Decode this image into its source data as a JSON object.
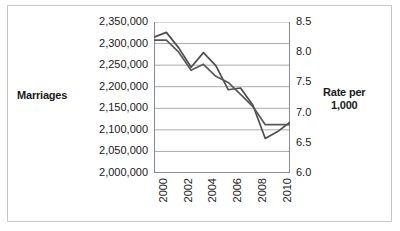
{
  "chart_data": {
    "type": "line",
    "title": "",
    "subtitle": "",
    "xlabel": "",
    "ylabel": "Marriages",
    "y2label": "Rate per 1,000",
    "grid": true,
    "legend": "none",
    "x": [
      2000,
      2001,
      2002,
      2003,
      2004,
      2005,
      2006,
      2007,
      2008,
      2009,
      2010,
      2011
    ],
    "xtick_labels": [
      "2000",
      "2002",
      "2004",
      "2006",
      "2008",
      "2010"
    ],
    "xtick_values": [
      2000,
      2002,
      2004,
      2006,
      2008,
      2010
    ],
    "xlim": [
      2000,
      2011
    ],
    "ylim": [
      2000000,
      2350000
    ],
    "ytick_labels": [
      "2,350,000",
      "2,300,000",
      "2,250,000",
      "2,200,000",
      "2,150,000",
      "2,100,000",
      "2,050,000",
      "2,000,000"
    ],
    "ytick_values": [
      2350000,
      2300000,
      2250000,
      2200000,
      2150000,
      2100000,
      2050000,
      2000000
    ],
    "y2lim": [
      6.0,
      8.5
    ],
    "y2tick_labels": [
      "8.5",
      "8.0",
      "7.5",
      "7.0",
      "6.5",
      "6.0"
    ],
    "y2tick_values": [
      8.5,
      8.0,
      7.5,
      7.0,
      6.5,
      6.0
    ],
    "series": [
      {
        "name": "Marriages",
        "axis": "left",
        "color": "#4d4d4d",
        "values": [
          2315000,
          2326000,
          2290000,
          2245000,
          2279000,
          2249000,
          2193000,
          2197000,
          2157000,
          2080000,
          2096000,
          2118000
        ]
      },
      {
        "name": "Rate per 1,000",
        "axis": "right",
        "color": "#595959",
        "values": [
          8.2,
          8.2,
          8.0,
          7.7,
          7.8,
          7.6,
          7.5,
          7.3,
          7.1,
          6.8,
          6.8,
          6.8
        ]
      }
    ],
    "colors": {
      "marriages_line": "#4d4d4d",
      "rate_line": "#595959",
      "gridline": "#aaaaaa",
      "axis": "#8c8c8c",
      "frame": "#c9c9c9",
      "text": "#1a1a1a"
    }
  },
  "labels": {
    "left_axis_title": "Marriages",
    "right_axis_title_line1": "Rate per",
    "right_axis_title_line2": "1,000"
  }
}
